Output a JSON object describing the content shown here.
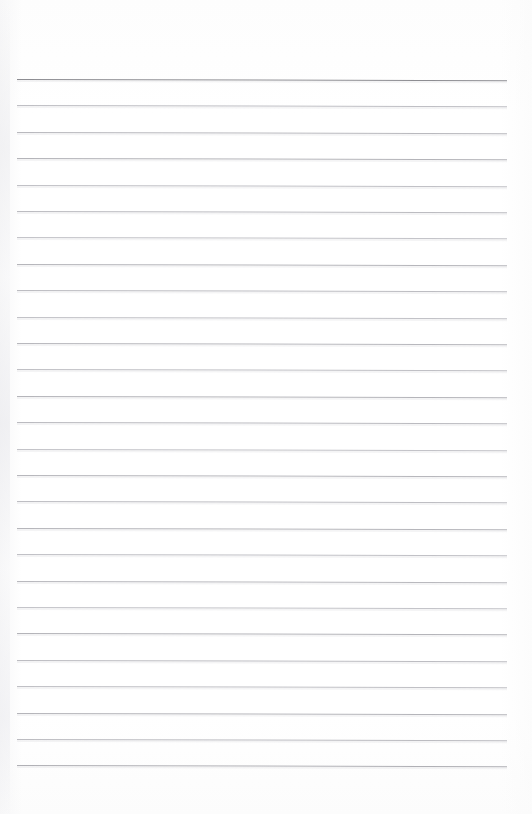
{
  "document": {
    "kind": "lined-notebook-paper-scan",
    "page_label": "",
    "orientation": "portrait",
    "background_color": "#fefefe",
    "text_content": "",
    "written_content": ""
  },
  "layout": {
    "width": 532,
    "height": 814,
    "rule_left_x": 17,
    "rule_right_x": 507,
    "first_rule_y": 79,
    "rule_spacing": 26.4,
    "rule_count": 27,
    "skew_degrees": 0.14,
    "top_margin": 79,
    "bottom_margin": 49
  },
  "colors": {
    "paper": "#fefefe",
    "header_rule": "#8d8d92",
    "body_rule": "#b9b9be",
    "body_rule_light": "#c6c6cb",
    "rule_halo": "#d7d7da",
    "edge_shade": "#f3f3f5"
  },
  "rules": [
    {
      "index": 1,
      "y": 79.0,
      "color": "#8d8d92",
      "thickness": 1.6,
      "role": "header-rule"
    },
    {
      "index": 2,
      "y": 105.4,
      "color": "#bfbfc4",
      "thickness": 0.9,
      "role": "body-rule"
    },
    {
      "index": 3,
      "y": 131.8,
      "color": "#b9b9be",
      "thickness": 1.0,
      "role": "body-rule"
    },
    {
      "index": 4,
      "y": 158.2,
      "color": "#b4b4b9",
      "thickness": 1.0,
      "role": "body-rule"
    },
    {
      "index": 5,
      "y": 184.6,
      "color": "#c1c1c6",
      "thickness": 0.9,
      "role": "body-rule"
    },
    {
      "index": 6,
      "y": 211.0,
      "color": "#bcbcc1",
      "thickness": 1.0,
      "role": "body-rule"
    },
    {
      "index": 7,
      "y": 237.4,
      "color": "#c4c4c9",
      "thickness": 0.9,
      "role": "body-rule"
    },
    {
      "index": 8,
      "y": 263.8,
      "color": "#b6b6bb",
      "thickness": 1.0,
      "role": "body-rule"
    },
    {
      "index": 9,
      "y": 290.2,
      "color": "#bdbdc2",
      "thickness": 1.0,
      "role": "body-rule"
    },
    {
      "index": 10,
      "y": 316.6,
      "color": "#c2c2c7",
      "thickness": 0.9,
      "role": "body-rule"
    },
    {
      "index": 11,
      "y": 343.0,
      "color": "#b8b8bd",
      "thickness": 1.0,
      "role": "body-rule"
    },
    {
      "index": 12,
      "y": 369.4,
      "color": "#c0c0c5",
      "thickness": 0.9,
      "role": "body-rule"
    },
    {
      "index": 13,
      "y": 395.8,
      "color": "#b5b5ba",
      "thickness": 1.0,
      "role": "body-rule"
    },
    {
      "index": 14,
      "y": 422.2,
      "color": "#bbbbc0",
      "thickness": 1.0,
      "role": "body-rule"
    },
    {
      "index": 15,
      "y": 448.6,
      "color": "#c3c3c8",
      "thickness": 0.9,
      "role": "body-rule"
    },
    {
      "index": 16,
      "y": 475.0,
      "color": "#b7b7bc",
      "thickness": 1.0,
      "role": "body-rule"
    },
    {
      "index": 17,
      "y": 501.4,
      "color": "#bebec3",
      "thickness": 0.9,
      "role": "body-rule"
    },
    {
      "index": 18,
      "y": 527.8,
      "color": "#b6b6bb",
      "thickness": 1.0,
      "role": "body-rule"
    },
    {
      "index": 19,
      "y": 554.2,
      "color": "#c1c1c6",
      "thickness": 0.9,
      "role": "body-rule"
    },
    {
      "index": 20,
      "y": 580.6,
      "color": "#b9b9be",
      "thickness": 1.0,
      "role": "body-rule"
    },
    {
      "index": 21,
      "y": 607.0,
      "color": "#c4c4c9",
      "thickness": 0.9,
      "role": "body-rule"
    },
    {
      "index": 22,
      "y": 633.4,
      "color": "#b4b4b9",
      "thickness": 1.0,
      "role": "body-rule"
    },
    {
      "index": 23,
      "y": 659.8,
      "color": "#bdbdc2",
      "thickness": 1.0,
      "role": "body-rule"
    },
    {
      "index": 24,
      "y": 686.2,
      "color": "#c0c0c5",
      "thickness": 0.9,
      "role": "body-rule"
    },
    {
      "index": 25,
      "y": 712.6,
      "color": "#b5b5ba",
      "thickness": 1.0,
      "role": "body-rule"
    },
    {
      "index": 26,
      "y": 739.0,
      "color": "#bcbcc1",
      "thickness": 1.0,
      "role": "body-rule"
    },
    {
      "index": 27,
      "y": 765.4,
      "color": "#b0b0b5",
      "thickness": 1.1,
      "role": "body-rule"
    }
  ]
}
